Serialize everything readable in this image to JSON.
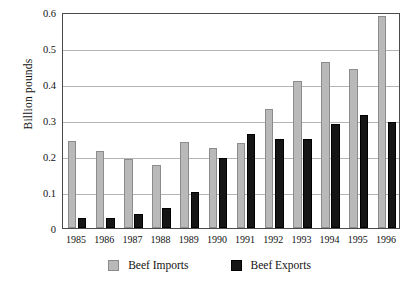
{
  "chart_data": {
    "type": "bar",
    "title": "",
    "xlabel": "",
    "ylabel": "Billion pounds",
    "ylim": [
      0,
      0.6
    ],
    "ytick_labels": [
      "0.6",
      "0.5",
      "0.4",
      "0.3",
      "0.2",
      "0.1",
      "0"
    ],
    "ytick_values": [
      0.6,
      0.5,
      0.4,
      0.3,
      0.2,
      0.1,
      0
    ],
    "grid": true,
    "legend_position": "bottom-center",
    "categories": [
      "1985",
      "1986",
      "1987",
      "1988",
      "1989",
      "1990",
      "1991",
      "1992",
      "1993",
      "1994",
      "1995",
      "1996"
    ],
    "series": [
      {
        "name": "Beef Imports",
        "color": "#b9b9b9",
        "values": [
          0.241,
          0.214,
          0.192,
          0.174,
          0.238,
          0.222,
          0.235,
          0.331,
          0.407,
          0.46,
          0.443,
          0.588
        ]
      },
      {
        "name": "Beef Exports",
        "color": "#151515",
        "values": [
          0.027,
          0.027,
          0.039,
          0.055,
          0.099,
          0.194,
          0.262,
          0.248,
          0.246,
          0.288,
          0.313,
          0.295
        ]
      }
    ]
  },
  "legend": {
    "items": [
      {
        "label": "Beef Imports",
        "swatch": "gray-square-swatch"
      },
      {
        "label": "Beef Exports",
        "swatch": "black-square-swatch"
      }
    ]
  }
}
